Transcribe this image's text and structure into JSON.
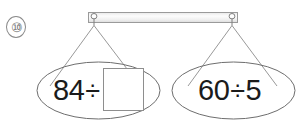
{
  "problem": {
    "number_label": "⑩",
    "type": "balance-scale-comparison"
  },
  "balance": {
    "bar": {
      "name": "balance-bar",
      "fill_color": "#f2f2f2",
      "stroke_color": "#9a9a9a"
    },
    "hooks": [
      {
        "name": "left-hook",
        "label": ""
      },
      {
        "name": "right-hook",
        "label": ""
      }
    ],
    "strings": {
      "stroke_color": "#8c8c8c"
    }
  },
  "left_sign": {
    "name": "left-oval-sign",
    "stroke_color": "#6e6e6e",
    "expression": {
      "operand_a": "84",
      "operator": "÷",
      "operand_b": "",
      "answer_box_empty": true
    }
  },
  "right_sign": {
    "name": "right-oval-sign",
    "stroke_color": "#6e6e6e",
    "expression": {
      "operand_a": "60",
      "operator": "÷",
      "operand_b": "5",
      "answer_box_empty": false
    }
  },
  "answer_box": {
    "name": "answer-input-box",
    "value": "",
    "stroke_color": "#8e8e8e"
  }
}
